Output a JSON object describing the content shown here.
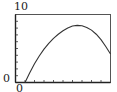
{
  "chart_data": {
    "type": "line",
    "title": "",
    "xlabel": "",
    "ylabel": "",
    "xlim": [
      0,
      10
    ],
    "ylim": [
      0,
      10
    ],
    "x_tick_step": 1,
    "y_tick_step": 1,
    "tick_labels": {
      "y_max": "10",
      "y_min": "0",
      "x_min": "0"
    },
    "grid": false,
    "legend": null,
    "series": [
      {
        "name": "curve",
        "color": "#333333",
        "x": [
          1.0,
          1.5,
          2.0,
          2.5,
          3.0,
          3.5,
          4.0,
          4.5,
          5.0,
          5.5,
          6.0,
          6.5,
          7.0,
          7.5,
          8.0,
          8.5,
          9.0,
          9.5,
          10.0
        ],
        "y": [
          0.0,
          1.45,
          2.75,
          3.9,
          4.9,
          5.75,
          6.5,
          7.1,
          7.6,
          8.0,
          8.3,
          8.4,
          8.35,
          8.1,
          7.7,
          7.1,
          6.3,
          5.3,
          4.2
        ]
      }
    ]
  },
  "labels": {
    "y_top": "10",
    "y_bottom": "0",
    "x_left": "0"
  }
}
